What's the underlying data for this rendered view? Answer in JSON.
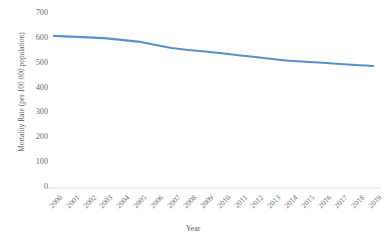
{
  "chart_data": {
    "type": "line",
    "title": "",
    "xlabel": "Year",
    "ylabel": "Mortality Rate (per 100 000 population)",
    "categories": [
      "2000",
      "2001",
      "2002",
      "2003",
      "2004",
      "2005",
      "2006",
      "2007",
      "2008",
      "2009",
      "2010",
      "2011",
      "2012",
      "2013",
      "2014",
      "2015",
      "2016",
      "2017",
      "2018",
      "2019"
    ],
    "series": [
      {
        "name": "Mortality Rate",
        "color": "#5b8fc9",
        "values": [
          612,
          609,
          606,
          603,
          596,
          589,
          576,
          563,
          555,
          549,
          542,
          534,
          527,
          519,
          512,
          508,
          504,
          499,
          495,
          491
        ]
      }
    ],
    "ylim": [
      0,
      700
    ],
    "y_ticks": [
      0,
      100,
      200,
      300,
      400,
      500,
      600,
      700
    ],
    "y_tick_labels": [
      "0",
      "100",
      "200",
      "300",
      "400",
      "500",
      "600",
      "700"
    ],
    "grid": false,
    "legend": false,
    "legend_position": "none",
    "axis_line_color": "#d9d9d9",
    "tick_label_color": "#6b6b6b",
    "background_color": "#ffffff"
  }
}
